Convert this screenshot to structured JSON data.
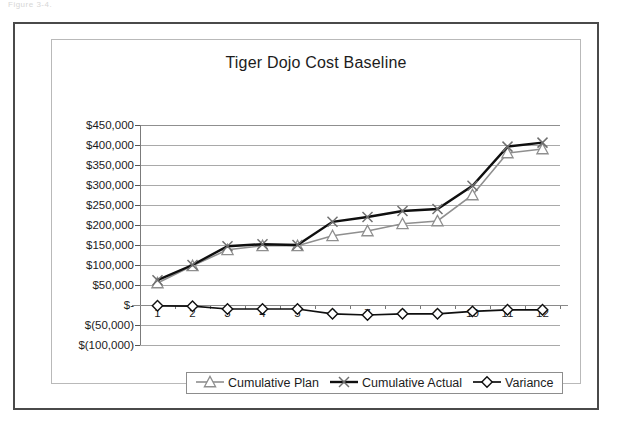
{
  "page": {
    "top_fragment": "Figure 3-4."
  },
  "chart": {
    "title": "Tiger Dojo Cost Baseline"
  },
  "legend": {
    "items": [
      {
        "label": "Cumulative Plan",
        "marker": "triangle-marker",
        "color": "#8c8c8c"
      },
      {
        "label": "Cumulative Actual",
        "marker": "cross-marker",
        "color": "#9a9a9a"
      },
      {
        "label": "Variance",
        "marker": "diamond-marker",
        "color": "#1a1a1a"
      }
    ]
  },
  "axes": {
    "y_tick_labels": [
      "$450,000",
      "$400,000",
      "$350,000",
      "$300,000",
      "$250,000",
      "$200,000",
      "$150,000",
      "$100,000",
      "$50,000",
      "$-",
      "$(50,000)",
      "$(100,000)"
    ],
    "x_tick_labels": [
      "1",
      "2",
      "3",
      "4",
      "5",
      "6",
      "7",
      "8",
      "9",
      "10",
      "11",
      "12"
    ]
  },
  "chart_data": {
    "type": "line",
    "title": "Tiger Dojo Cost Baseline",
    "xlabel": "",
    "ylabel": "",
    "ylim": [
      -100000,
      450000
    ],
    "ytick_step": 50000,
    "grid": true,
    "legend_position": "bottom",
    "x": [
      1,
      2,
      3,
      4,
      5,
      6,
      7,
      8,
      9,
      10,
      11,
      12
    ],
    "categories": [
      "1",
      "2",
      "3",
      "4",
      "5",
      "6",
      "7",
      "8",
      "9",
      "10",
      "11",
      "12"
    ],
    "series": [
      {
        "name": "Cumulative Plan",
        "marker": "triangle",
        "color": "#8c8c8c",
        "values": [
          55000,
          98000,
          138000,
          148000,
          148000,
          173000,
          185000,
          203000,
          210000,
          275000,
          380000,
          390000
        ]
      },
      {
        "name": "Cumulative Actual",
        "marker": "x",
        "color": "#141414",
        "values": [
          62000,
          100000,
          147000,
          152000,
          150000,
          208000,
          220000,
          235000,
          240000,
          298000,
          396000,
          406000
        ]
      },
      {
        "name": "Variance",
        "marker": "diamond",
        "color": "#141414",
        "values": [
          -2000,
          -3000,
          -10000,
          -10000,
          -10000,
          -22000,
          -25000,
          -22000,
          -22000,
          -16000,
          -12000,
          -12000
        ]
      }
    ]
  }
}
